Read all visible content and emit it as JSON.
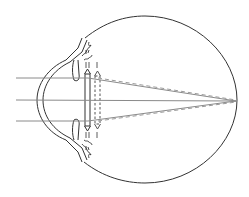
{
  "diagram": {
    "colors": {
      "outline": "#333333",
      "ray": "#8a8a8a",
      "dashed_ray": "#9a9a9a",
      "background": "#ffffff"
    },
    "rays": [
      {
        "y": 78
      },
      {
        "y": 100
      },
      {
        "y": 121
      }
    ],
    "focal_point": {
      "x": 236,
      "y": 101
    },
    "eyeball": {
      "cx": 145,
      "cy": 100,
      "r": 92
    }
  }
}
